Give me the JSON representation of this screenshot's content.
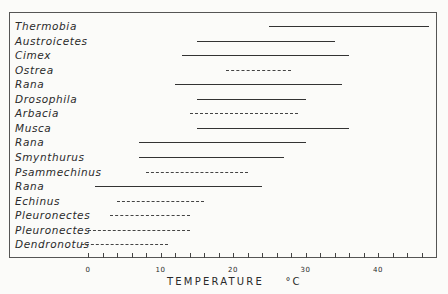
{
  "chart_data": {
    "type": "range-bar",
    "title": "",
    "xlabel": "TEMPERATURE °C",
    "xlabel_main": "TEMPERATURE",
    "xlabel_unit": "°C",
    "ylabel": "",
    "xlim": [
      -1,
      48
    ],
    "x_tick_labels": [
      "0",
      "10",
      "20",
      "30",
      "40"
    ],
    "x_ticks": [
      0,
      10,
      20,
      30,
      40
    ],
    "x_minor_step": 2,
    "grid": false,
    "legend": "solid line = one type of record; dashed line = other type",
    "series": [
      {
        "name": "Thermobia",
        "min": 25,
        "max": 47,
        "style": "solid"
      },
      {
        "name": "Austroicetes",
        "min": 15,
        "max": 34,
        "style": "solid"
      },
      {
        "name": "Cimex",
        "min": 13,
        "max": 36,
        "style": "solid"
      },
      {
        "name": "Ostrea",
        "min": 19,
        "max": 28,
        "style": "dashed"
      },
      {
        "name": "Rana",
        "min": 12,
        "max": 35,
        "style": "solid"
      },
      {
        "name": "Drosophila",
        "min": 15,
        "max": 30,
        "style": "solid"
      },
      {
        "name": "Arbacia",
        "min": 14,
        "max": 29,
        "style": "dashed"
      },
      {
        "name": "Musca",
        "min": 15,
        "max": 36,
        "style": "solid"
      },
      {
        "name": "Rana",
        "min": 7,
        "max": 30,
        "style": "solid"
      },
      {
        "name": "Smynthurus",
        "min": 7,
        "max": 27,
        "style": "solid"
      },
      {
        "name": "Psammechinus",
        "min": 8,
        "max": 22,
        "style": "dashed"
      },
      {
        "name": "Rana",
        "min": 1,
        "max": 24,
        "style": "solid"
      },
      {
        "name": "Echinus",
        "min": 4,
        "max": 16,
        "style": "dashed"
      },
      {
        "name": "Pleuronectes",
        "min": 3,
        "max": 14,
        "style": "dashed"
      },
      {
        "name": "Pleuronectes",
        "min": 0,
        "max": 14,
        "style": "dashed"
      },
      {
        "name": "Dendronotus",
        "min": -1,
        "max": 11,
        "style": "dashed"
      }
    ]
  }
}
